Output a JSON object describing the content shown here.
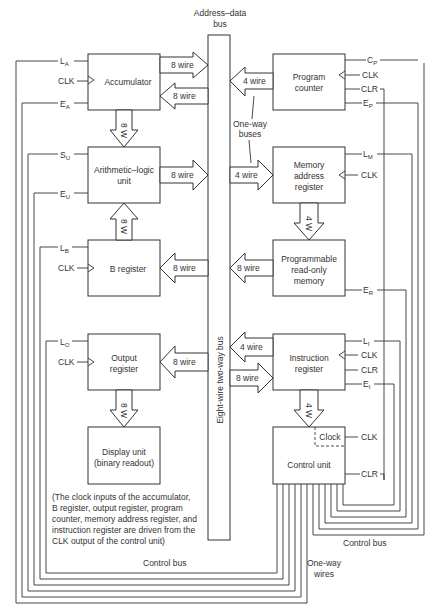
{
  "title": {
    "bus_line1": "Address–data",
    "bus_line2": "bus",
    "bus_vertical": "Eight-wire two-way bus"
  },
  "blocks": {
    "accumulator": "Accumulator",
    "alu_line1": "Arithmetic–logic",
    "alu_line2": "unit",
    "b_register": "B register",
    "output_line1": "Output",
    "output_line2": "register",
    "display_line1": "Display unit",
    "display_line2": "(binary readout)",
    "pc_line1": "Program",
    "pc_line2": "counter",
    "mar_line1": "Memory",
    "mar_line2": "address",
    "mar_line3": "register",
    "prom_line1": "Programmable",
    "prom_line2": "read-only",
    "prom_line3": "memory",
    "ir_line1": "Instruction",
    "ir_line2": "register",
    "control_unit": "Control unit",
    "clock": "Clock"
  },
  "signals": {
    "L": "L",
    "E": "E",
    "S": "S",
    "C": "C",
    "sub_A": "A",
    "sub_U": "U",
    "sub_B": "B",
    "sub_O": "O",
    "sub_P": "P",
    "sub_M": "M",
    "sub_R": "R",
    "sub_I": "I",
    "clk": "CLK",
    "clr": "CLR"
  },
  "bus_widths": {
    "eight_wire": "8 wire",
    "four_wire": "4 wire",
    "eight_w": "8 W",
    "four_w": "4 W"
  },
  "annotations": {
    "one_way_buses_line1": "One-way",
    "one_way_buses_line2": "buses",
    "one_way_wires_line1": "One-way",
    "one_way_wires_line2": "wires",
    "control_bus": "Control bus",
    "note_lines": [
      "(The clock inputs of the accumulator,",
      "B register, output register, program",
      "counter, memory address register, and",
      "instruction register are driven from the",
      "CLK output of the control unit)"
    ]
  }
}
